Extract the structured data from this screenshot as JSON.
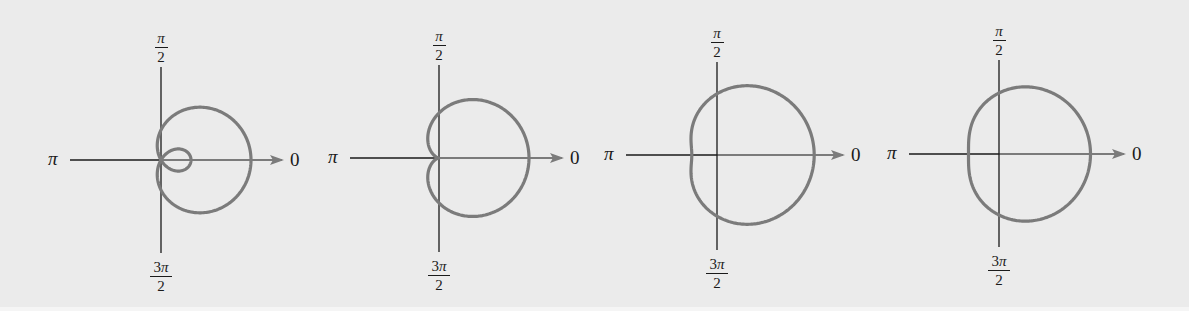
{
  "figure": {
    "axis_labels": {
      "zero": "0",
      "pi": "π",
      "half_pi_num": "π",
      "half_pi_den": "2",
      "three_half_pi_num_coeff": "3",
      "three_half_pi_num_sym": "π",
      "three_half_pi_den": "2"
    },
    "colors": {
      "background": "#ebebeb",
      "axis": "#1a1a1a",
      "curve": "#7b7b7b"
    }
  },
  "chart_data": [
    {
      "type": "line",
      "coordinate_system": "polar",
      "title": "Limaçon with inner loop",
      "equation": "r = 1 + 2cos θ",
      "a": 1,
      "b": 2,
      "ratio_a_over_b": 0.5,
      "axis_labels": [
        "0",
        "π/2",
        "π",
        "3π/2"
      ],
      "render": {
        "cx": 161,
        "cy": 160,
        "scale": 30,
        "x_left": 70,
        "x_right": 282,
        "y_top": 67,
        "y_bottom": 253
      }
    },
    {
      "type": "line",
      "coordinate_system": "polar",
      "title": "Cardioid",
      "equation": "r = 1 + cos θ",
      "a": 1,
      "b": 1,
      "ratio_a_over_b": 1,
      "axis_labels": [
        "0",
        "π/2",
        "π",
        "3π/2"
      ],
      "render": {
        "cx": 439,
        "cy": 158,
        "scale": 45,
        "x_left": 350,
        "x_right": 562,
        "y_top": 65,
        "y_bottom": 252
      }
    },
    {
      "type": "line",
      "coordinate_system": "polar",
      "title": "Dimpled limaçon",
      "equation": "r = 1.7 + cos θ",
      "a": 1.7,
      "b": 1,
      "ratio_a_over_b": 1.7,
      "axis_labels": [
        "0",
        "π/2",
        "π",
        "3π/2"
      ],
      "render": {
        "cx": 717,
        "cy": 155,
        "scale": 36,
        "x_left": 626,
        "x_right": 843,
        "y_top": 62,
        "y_bottom": 250
      }
    },
    {
      "type": "line",
      "coordinate_system": "polar",
      "title": "Convex limaçon",
      "equation": "r = 2 + cos θ",
      "a": 2,
      "b": 1,
      "ratio_a_over_b": 2,
      "axis_labels": [
        "0",
        "π/2",
        "π",
        "3π/2"
      ],
      "render": {
        "cx": 999,
        "cy": 154,
        "scale": 30.5,
        "x_left": 909,
        "x_right": 1124,
        "y_top": 60,
        "y_bottom": 247
      }
    }
  ]
}
